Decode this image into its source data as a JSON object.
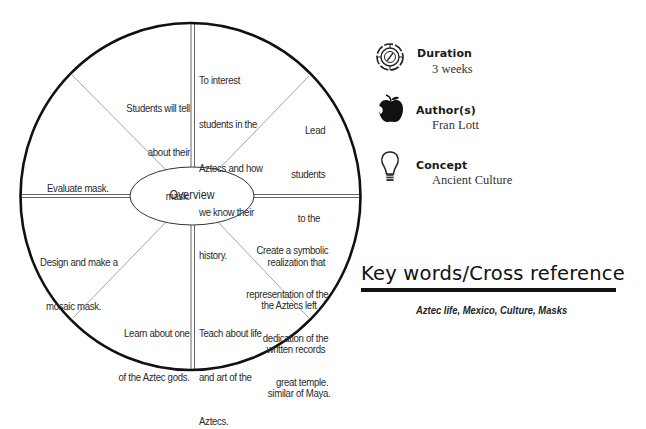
{
  "wheel": {
    "center_label": "Overview",
    "segments": [
      {
        "position": "top-right",
        "lines": [
          "To interest",
          "students in the",
          "Aztecs and how",
          "we know their",
          "history."
        ]
      },
      {
        "position": "right-upper",
        "lines": [
          "Lead",
          "students",
          "to the",
          "realization that",
          "the Aztecs left",
          "written records",
          "similar of Maya."
        ]
      },
      {
        "position": "right-lower",
        "lines": [
          "Create a symbolic",
          "representation of the",
          "dedication of the",
          "great temple."
        ]
      },
      {
        "position": "bottom-right",
        "lines": [
          "Teach about life",
          "and art of the",
          "Aztecs."
        ]
      },
      {
        "position": "bottom-left",
        "lines": [
          "Learn about one",
          "of the Aztec gods."
        ]
      },
      {
        "position": "left-lower",
        "lines": [
          "Design and make a",
          "mosaic mask."
        ]
      },
      {
        "position": "left-upper",
        "lines": [
          "Evaluate mask."
        ]
      },
      {
        "position": "top-left",
        "lines": [
          "Students will tell",
          "about their",
          "mask."
        ]
      }
    ],
    "colors": {
      "outline": "#111111",
      "divider": "#888888",
      "text": "#2a2a2a"
    }
  },
  "info": {
    "duration": {
      "icon": "compass-badge-icon",
      "title": "Duration",
      "value": "3 weeks"
    },
    "author": {
      "icon": "apple-icon",
      "title": "Author(s)",
      "value": "Fran Lott"
    },
    "concept": {
      "icon": "lightbulb-icon",
      "title": "Concept",
      "value": "Ancient Culture"
    }
  },
  "keywords": {
    "title": "Key words/Cross reference",
    "list": "Aztec life, Mexico, Culture, Masks"
  }
}
